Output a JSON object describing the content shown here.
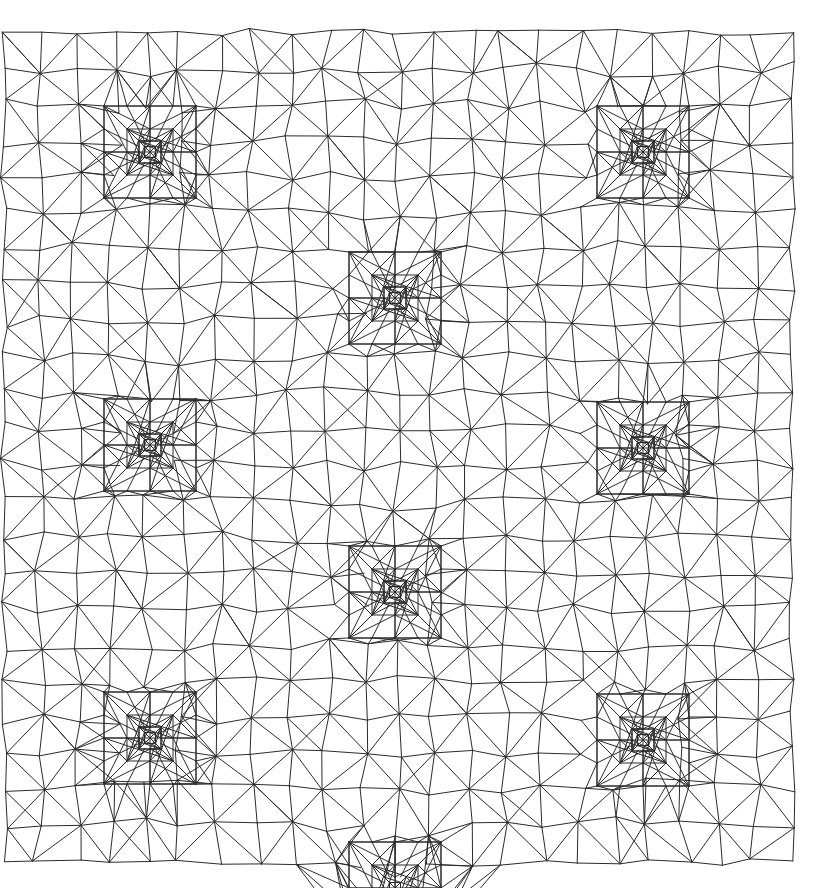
{
  "figure": {
    "kind": "adaptive-triangular-finite-element-mesh",
    "title": "",
    "background_color": "#ffffff",
    "line_color": "#2b2b2b",
    "line_width": 1.0,
    "width": 820,
    "height": 888
  },
  "chart_data": {
    "type": "diagram",
    "title": "",
    "subtitle": "",
    "xlabel": "",
    "ylabel": "",
    "grid": false,
    "legend": null,
    "annotations": [],
    "mesh": {
      "description": "Unstructured graded triangular mesh on a square domain with nine local refinement centres arranged on a 3x3 lattice. Each centre carries nested concentric square refinement levels.",
      "domain": {
        "x_min": 4,
        "y_min": 32,
        "x_max": 792,
        "y_max": 862
      },
      "boundary_waviness_px": 7,
      "base_cells_x": 22,
      "base_cells_y": 23,
      "jitter_amplitude_px": 5.5,
      "refinement_levels": 3,
      "refinement_centers": [
        {
          "id": "c1",
          "x": 150,
          "y": 152,
          "levels": 3
        },
        {
          "id": "c2",
          "x": 395,
          "y": 298,
          "levels": 3
        },
        {
          "id": "c3",
          "x": 643,
          "y": 152,
          "levels": 3
        },
        {
          "id": "c4",
          "x": 150,
          "y": 445,
          "levels": 3
        },
        {
          "id": "c5",
          "x": 395,
          "y": 592,
          "levels": 3
        },
        {
          "id": "c6",
          "x": 643,
          "y": 448,
          "levels": 3
        },
        {
          "id": "c7",
          "x": 150,
          "y": 738,
          "levels": 3
        },
        {
          "id": "c8",
          "x": 395,
          "y": 888,
          "levels": 2
        },
        {
          "id": "c9",
          "x": 643,
          "y": 740,
          "levels": 3
        }
      ],
      "refinement_ring_radii_px": [
        46,
        23,
        11
      ],
      "element_type": "triangle",
      "approx_element_count": 2600,
      "approx_node_count": 1340
    }
  }
}
